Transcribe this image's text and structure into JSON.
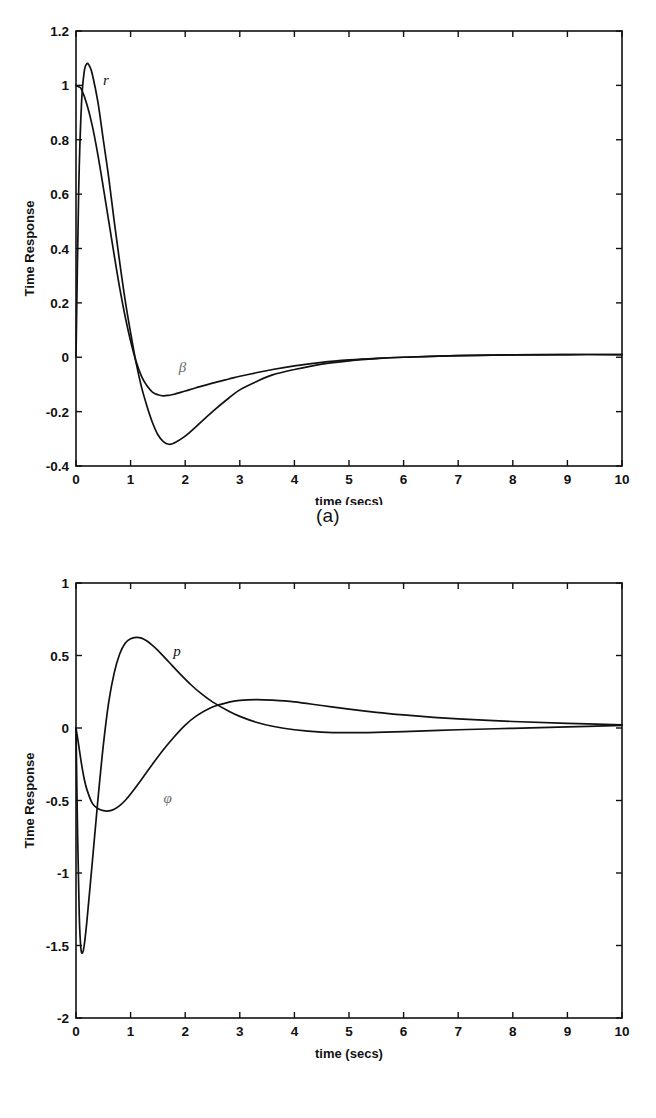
{
  "figure": {
    "panels": [
      {
        "id": "a",
        "caption": "(a)",
        "ylabel": "Time Response",
        "xlabel": "time (secs)",
        "xticklabels": [
          "0",
          "1",
          "2",
          "3",
          "4",
          "5",
          "6",
          "7",
          "8",
          "9",
          "10"
        ],
        "yticklabels": [
          "-0.4",
          "-0.2",
          "0",
          "0.2",
          "0.4",
          "0.6",
          "0.8",
          "1",
          "1.2"
        ],
        "curve_labels": [
          {
            "text": "r",
            "x": 0.55,
            "y": 1.0
          },
          {
            "text": "β",
            "x": 1.95,
            "y": -0.055
          }
        ]
      },
      {
        "id": "b",
        "caption": "(b)",
        "ylabel": "Time Response",
        "xlabel": "time (secs)",
        "xticklabels": [
          "0",
          "1",
          "2",
          "3",
          "4",
          "5",
          "6",
          "7",
          "8",
          "9",
          "10"
        ],
        "yticklabels": [
          "-2",
          "-1.5",
          "-1",
          "-0.5",
          "0",
          "0.5",
          "1"
        ],
        "curve_labels": [
          {
            "text": "p",
            "x": 1.85,
            "y": 0.5
          },
          {
            "text": "φ",
            "x": 1.68,
            "y": -0.52
          }
        ]
      }
    ]
  },
  "chart_data": [
    {
      "type": "line",
      "title": "",
      "panel": "(a)",
      "xlabel": "time (secs)",
      "ylabel": "Time Response",
      "xlim": [
        0,
        10
      ],
      "ylim": [
        -0.4,
        1.2
      ],
      "xticks": [
        0,
        1,
        2,
        3,
        4,
        5,
        6,
        7,
        8,
        9,
        10
      ],
      "yticks": [
        -0.4,
        -0.2,
        0,
        0.2,
        0.4,
        0.6,
        0.8,
        1,
        1.2
      ],
      "grid": false,
      "legend": "inline-curve-labels",
      "series": [
        {
          "name": "r",
          "label_position": [
            0.55,
            1.0
          ],
          "x": [
            0,
            0.05,
            0.1,
            0.15,
            0.2,
            0.25,
            0.3,
            0.4,
            0.5,
            0.6,
            0.7,
            0.8,
            0.9,
            1.0,
            1.1,
            1.2,
            1.3,
            1.4,
            1.5,
            1.6,
            1.7,
            1.8,
            2.0,
            2.2,
            2.5,
            2.8,
            3.0,
            3.3,
            3.6,
            4.0,
            4.5,
            5.0,
            5.5,
            6.0,
            7.0,
            8.0,
            9.0,
            10.0
          ],
          "y": [
            0.0,
            0.62,
            0.93,
            1.05,
            1.08,
            1.07,
            1.04,
            0.94,
            0.8,
            0.66,
            0.5,
            0.35,
            0.21,
            0.09,
            -0.02,
            -0.11,
            -0.18,
            -0.24,
            -0.285,
            -0.31,
            -0.32,
            -0.315,
            -0.29,
            -0.255,
            -0.2,
            -0.15,
            -0.12,
            -0.09,
            -0.065,
            -0.045,
            -0.025,
            -0.013,
            -0.005,
            0.0,
            0.006,
            0.009,
            0.01,
            0.01
          ]
        },
        {
          "name": "β",
          "label_position": [
            1.95,
            -0.055
          ],
          "x": [
            0,
            0.05,
            0.1,
            0.2,
            0.3,
            0.4,
            0.5,
            0.6,
            0.7,
            0.8,
            0.9,
            1.0,
            1.1,
            1.2,
            1.3,
            1.4,
            1.5,
            1.6,
            1.7,
            1.8,
            2.0,
            2.2,
            2.5,
            2.8,
            3.0,
            3.3,
            3.6,
            4.0,
            4.5,
            5.0,
            5.5,
            6.0,
            7.0,
            8.0,
            9.0,
            10.0
          ],
          "y": [
            1.0,
            0.995,
            0.985,
            0.93,
            0.85,
            0.745,
            0.625,
            0.5,
            0.375,
            0.255,
            0.15,
            0.06,
            -0.015,
            -0.07,
            -0.105,
            -0.128,
            -0.138,
            -0.142,
            -0.14,
            -0.136,
            -0.124,
            -0.112,
            -0.095,
            -0.08,
            -0.07,
            -0.057,
            -0.045,
            -0.032,
            -0.019,
            -0.01,
            -0.004,
            0.0,
            0.006,
            0.009,
            0.01,
            0.01
          ]
        }
      ]
    },
    {
      "type": "line",
      "title": "",
      "panel": "(b)",
      "xlabel": "time (secs)",
      "ylabel": "Time Response",
      "xlim": [
        0,
        10
      ],
      "ylim": [
        -2,
        1
      ],
      "xticks": [
        0,
        1,
        2,
        3,
        4,
        5,
        6,
        7,
        8,
        9,
        10
      ],
      "yticks": [
        -2,
        -1.5,
        -1,
        -0.5,
        0,
        0.5,
        1
      ],
      "grid": false,
      "legend": "inline-curve-labels",
      "series": [
        {
          "name": "p",
          "label_position": [
            1.85,
            0.5
          ],
          "x": [
            0,
            0.03,
            0.06,
            0.09,
            0.12,
            0.15,
            0.2,
            0.3,
            0.4,
            0.5,
            0.6,
            0.7,
            0.8,
            0.9,
            1.0,
            1.1,
            1.2,
            1.3,
            1.4,
            1.5,
            1.7,
            1.9,
            2.1,
            2.3,
            2.5,
            2.8,
            3.0,
            3.3,
            3.6,
            4.0,
            4.5,
            5.0,
            5.5,
            6.0,
            7.0,
            8.0,
            9.0,
            10.0
          ],
          "y": [
            0.0,
            -0.75,
            -1.3,
            -1.52,
            -1.55,
            -1.5,
            -1.33,
            -0.92,
            -0.5,
            -0.12,
            0.18,
            0.38,
            0.51,
            0.585,
            0.615,
            0.625,
            0.62,
            0.6,
            0.57,
            0.535,
            0.455,
            0.375,
            0.3,
            0.235,
            0.18,
            0.115,
            0.08,
            0.04,
            0.012,
            -0.012,
            -0.028,
            -0.032,
            -0.03,
            -0.025,
            -0.012,
            -0.002,
            0.008,
            0.018
          ]
        },
        {
          "name": "φ",
          "label_position": [
            1.68,
            -0.52
          ],
          "x": [
            0,
            0.05,
            0.1,
            0.15,
            0.2,
            0.3,
            0.4,
            0.5,
            0.6,
            0.7,
            0.8,
            0.9,
            1.0,
            1.2,
            1.4,
            1.6,
            1.8,
            2.0,
            2.2,
            2.5,
            2.8,
            3.0,
            3.3,
            3.6,
            4.0,
            4.5,
            5.0,
            5.5,
            6.0,
            6.5,
            7.0,
            8.0,
            9.0,
            10.0
          ],
          "y": [
            0.0,
            -0.12,
            -0.245,
            -0.35,
            -0.425,
            -0.52,
            -0.555,
            -0.57,
            -0.572,
            -0.56,
            -0.535,
            -0.5,
            -0.455,
            -0.355,
            -0.25,
            -0.15,
            -0.06,
            0.02,
            0.082,
            0.145,
            0.178,
            0.19,
            0.196,
            0.192,
            0.18,
            0.155,
            0.13,
            0.108,
            0.09,
            0.075,
            0.063,
            0.045,
            0.032,
            0.022
          ]
        }
      ]
    }
  ]
}
